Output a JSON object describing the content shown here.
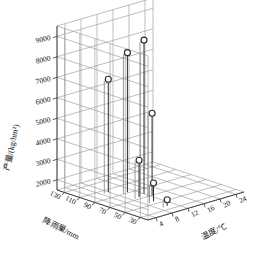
{
  "chart_data": {
    "type": "scatter",
    "title": "",
    "projection": "3d-stem",
    "xlabel": "温度/℃",
    "ylabel": "降雨量/mm",
    "zlabel": "产量/(kg/hm²)",
    "xticks": [
      "4",
      "8",
      "12",
      "16",
      "20",
      "24"
    ],
    "yticks": [
      "130",
      "110",
      "90",
      "70",
      "50",
      "30"
    ],
    "zticks": [
      "2000",
      "3000",
      "4000",
      "5000",
      "6000",
      "7000",
      "8000",
      "9000"
    ],
    "xlim": [
      2,
      26
    ],
    "ylim": [
      20,
      140
    ],
    "zlim": [
      1500,
      9500
    ],
    "grid": true,
    "legend": null,
    "marker": "open-circle",
    "points": [
      {
        "temperature": 12.0,
        "rainfall": 78,
        "yield": 9000
      },
      {
        "temperature": 10.5,
        "rainfall": 92,
        "yield": 8300
      },
      {
        "temperature": 8.0,
        "rainfall": 104,
        "yield": 7000
      },
      {
        "temperature": 12.5,
        "rainfall": 70,
        "yield": 5500
      },
      {
        "temperature": 10.0,
        "rainfall": 74,
        "yield": 3300
      },
      {
        "temperature": 10.2,
        "rainfall": 56,
        "yield": 2400
      },
      {
        "temperature": 10.2,
        "rainfall": 38,
        "yield": 1800
      }
    ]
  },
  "axes": {
    "z_axis_name": "yield-axis",
    "y_axis_name": "rainfall-axis",
    "x_axis_name": "temperature-axis"
  },
  "colors": {
    "line": "#2b2b2b",
    "grid": "#9a9a9a",
    "marker_fill": "#ffffff",
    "background": "#ffffff"
  }
}
